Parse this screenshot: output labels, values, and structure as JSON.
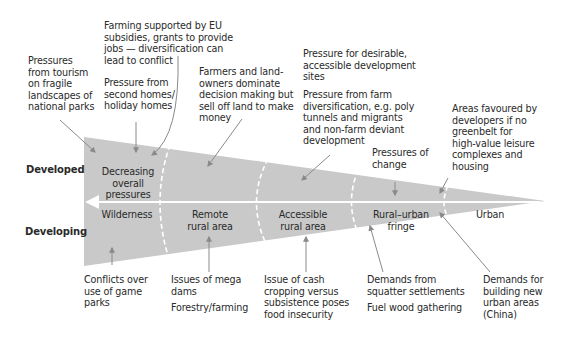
{
  "rows": {
    "developed": "Developed",
    "developing": "Developing"
  },
  "wedge": {
    "fill": "#c9c9c9",
    "arrow_color": "#ffffff",
    "zones": [
      {
        "id": "wilderness",
        "label": "Wilderness"
      },
      {
        "id": "remote",
        "label": "Remote\nrural area"
      },
      {
        "id": "accessible",
        "label": "Accessible\nrural area"
      },
      {
        "id": "fringe",
        "label": "Rural–urban\nfringe"
      },
      {
        "id": "urban",
        "label": "Urban"
      }
    ],
    "inner_labels": {
      "decreasing": "Decreasing\noverall\npressures",
      "pressures_change": "Pressures of\nchange"
    }
  },
  "developed_notes": [
    {
      "id": "tourism",
      "text": "Pressures\nfrom tourism\non fragile\nlandscapes of\nnational parks"
    },
    {
      "id": "eu",
      "text": "Farming supported by EU\nsubsidies, grants to provide\njobs — diversification can\nlead to conflict"
    },
    {
      "id": "second_homes",
      "text": "Pressure from\nsecond homes/\nholiday homes"
    },
    {
      "id": "farmers",
      "text": "Farmers and land-\nowners dominate\ndecision making but\nsell off land to make\nmoney"
    },
    {
      "id": "desirable",
      "text": "Pressure for desirable,\naccessible development\nsites"
    },
    {
      "id": "diversification",
      "text": "Pressure from farm\ndiversification, e.g. poly\ntunnels and migrants\nand non-farm deviant\ndevelopment"
    },
    {
      "id": "developers",
      "text": "Areas favoured by\ndevelopers if no\ngreenbelt for\nhigh-value leisure\ncomplexes and\nhousing"
    }
  ],
  "developing_notes": [
    {
      "id": "game_parks",
      "text": "Conflicts over\nuse of game\nparks"
    },
    {
      "id": "mega_dams",
      "text": "Issues of mega\ndams"
    },
    {
      "id": "forestry",
      "text": "Forestry/farming"
    },
    {
      "id": "cash_crop",
      "text": "Issue of cash\ncropping versus\nsubsistence poses\nfood insecurity"
    },
    {
      "id": "squatter",
      "text": "Demands from\nsquatter settlements"
    },
    {
      "id": "fuel_wood",
      "text": "Fuel wood gathering"
    },
    {
      "id": "china",
      "text": "Demands for\nbuilding new\nurban areas\n(China)"
    }
  ]
}
